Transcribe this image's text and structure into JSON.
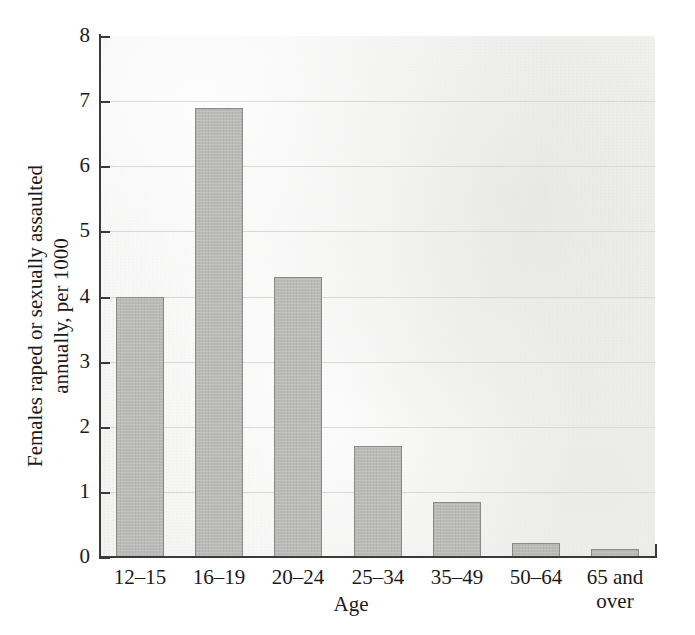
{
  "chart_data": {
    "type": "bar",
    "title": "",
    "xlabel": "Age",
    "ylabel": "Females raped or sexually assaulted\nannually, per 1000",
    "categories": [
      "12–15",
      "16–19",
      "20–24",
      "25–34",
      "35–49",
      "50–64",
      "65 and\nover"
    ],
    "values": [
      4.0,
      6.9,
      4.3,
      1.7,
      0.85,
      0.22,
      0.12
    ],
    "ylim": [
      0,
      8
    ],
    "yticks": [
      0,
      1,
      2,
      3,
      4,
      5,
      6,
      7,
      8
    ],
    "ytick_labels": [
      "0",
      "1",
      "2",
      "3",
      "4",
      "5",
      "6",
      "7",
      "8"
    ],
    "grid": true,
    "grid_axis": "y",
    "legend": "none",
    "bar_color": "#b9b9b7",
    "bar_edge_color": "#8a8a88",
    "plot_background": "#f2f2f1",
    "gridline_color": "#d8d8d6",
    "axis_color": "#3a3a3a"
  }
}
